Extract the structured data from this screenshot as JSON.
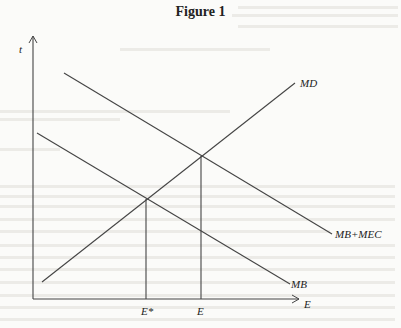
{
  "figure": {
    "title": "Figure 1",
    "y_axis_label": "t",
    "x_axis_label": "E",
    "curves": [
      {
        "name": "MD",
        "label": "MD",
        "from": [
          42,
          282
        ],
        "to": [
          295,
          83
        ]
      },
      {
        "name": "MB+MEC",
        "label": "MB+MEC",
        "from": [
          64,
          73
        ],
        "to": [
          332,
          234
        ]
      },
      {
        "name": "MB",
        "label": "MB",
        "from": [
          37,
          133
        ],
        "to": [
          290,
          284
        ]
      }
    ],
    "markers": [
      {
        "label": "E*",
        "x": 146,
        "intersection_y": 199
      },
      {
        "label": "E",
        "x": 201,
        "intersection_y": 156
      }
    ],
    "colors": {
      "line": "#444444",
      "text": "#222222",
      "background": "#fbfbf9"
    }
  }
}
